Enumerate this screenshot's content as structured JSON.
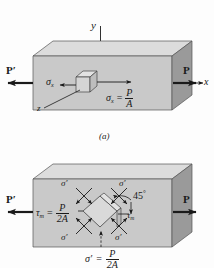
{
  "figure": {
    "title_caption_a": "(a)",
    "background_color": "#fdfdfd",
    "ink_color": "#1a1a1a",
    "block_face_color": "#c9c9c9",
    "block_top_color": "#dcdcdc",
    "block_end_color": "#9a9a9a",
    "element_face_color": "#d5d5d5"
  },
  "panel_a": {
    "name": "axial-normal-stress-diagram",
    "axis_y": "y",
    "axis_x": "x",
    "axis_z": "z",
    "load_left": "P",
    "load_left_prime": "′",
    "load_right": "P",
    "sigma_left": "σ",
    "sigma_left_sub": "x",
    "sigma_right": "σ",
    "sigma_right_sub": "x",
    "equals": "=",
    "stress_numerator": "P",
    "stress_denominator": "A"
  },
  "panel_b": {
    "name": "maximum-shear-stress-diagram",
    "load_left": "P",
    "load_left_prime": "′",
    "load_right": "P",
    "tau_symbol": "τ",
    "tau_sub": "m",
    "tau_equals": "=",
    "tau_numerator": "P",
    "tau_denominator": "2A",
    "tau_inner_symbol": "τ",
    "tau_inner_sub": "m",
    "angle_label": "45",
    "angle_degree": "°",
    "sigma_prime_top_left": "σ′",
    "sigma_prime_top_right": "σ′",
    "sigma_prime_bottom_left": "σ′",
    "sigma_prime_bottom_right": "σ′",
    "sigma_prime_caption": "σ′",
    "caption_equals": "=",
    "caption_numerator": "P",
    "caption_denominator": "2A"
  }
}
